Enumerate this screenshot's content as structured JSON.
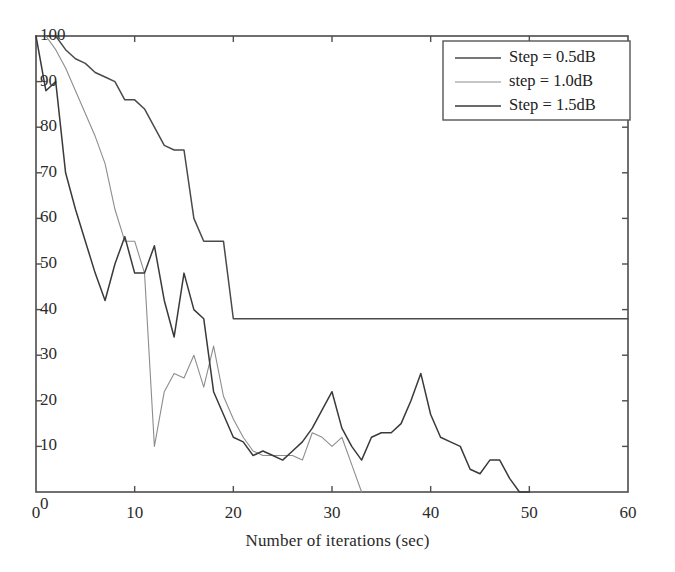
{
  "chart_data": {
    "type": "line",
    "title": "",
    "xlabel": "Number of iterations (sec)",
    "ylabel": "",
    "xlim": [
      0,
      60
    ],
    "ylim": [
      0,
      100
    ],
    "xticks": [
      0,
      10,
      20,
      30,
      40,
      50,
      60
    ],
    "yticks": [
      0,
      10,
      20,
      30,
      40,
      50,
      60,
      70,
      80,
      90,
      100
    ],
    "grid": false,
    "legend_position": "top-right",
    "series": [
      {
        "name": "Step = 0.5dB",
        "color": "#4a4a4a",
        "x": [
          0,
          1,
          2,
          3,
          4,
          5,
          6,
          7,
          8,
          9,
          10,
          11,
          12,
          13,
          14,
          15,
          16,
          17,
          18,
          19,
          20,
          25,
          30,
          35,
          40,
          45,
          50,
          55,
          60
        ],
        "y": [
          100,
          100,
          100,
          97,
          95,
          94,
          92,
          91,
          90,
          86,
          86,
          84,
          80,
          76,
          75,
          75,
          60,
          55,
          55,
          55,
          38,
          38,
          38,
          38,
          38,
          38,
          38,
          38,
          38
        ]
      },
      {
        "name": "step = 1.0dB",
        "color": "#8d8d8d",
        "x": [
          0,
          1,
          2,
          3,
          4,
          5,
          6,
          7,
          8,
          9,
          10,
          11,
          12,
          13,
          14,
          15,
          16,
          17,
          18,
          19,
          20,
          21,
          22,
          23,
          24,
          25,
          26,
          27,
          28,
          29,
          30,
          31,
          32,
          33
        ],
        "y": [
          100,
          100,
          97,
          93,
          88,
          83,
          78,
          72,
          62,
          55,
          55,
          48,
          10,
          22,
          26,
          25,
          30,
          23,
          32,
          21,
          16,
          12,
          9,
          8,
          8,
          8,
          8,
          7,
          13,
          12,
          10,
          12,
          6,
          0
        ]
      },
      {
        "name": "Step = 1.5dB",
        "color": "#3a3a3a",
        "x": [
          0,
          1,
          2,
          3,
          4,
          5,
          6,
          7,
          8,
          9,
          10,
          11,
          12,
          13,
          14,
          15,
          16,
          17,
          18,
          19,
          20,
          21,
          22,
          23,
          24,
          25,
          26,
          27,
          28,
          29,
          30,
          31,
          32,
          33,
          34,
          35,
          36,
          37,
          38,
          39,
          40,
          41,
          42,
          43,
          44,
          45,
          46,
          47,
          48,
          49,
          50
        ],
        "y": [
          100,
          88,
          90,
          70,
          62,
          55,
          48,
          42,
          50,
          56,
          48,
          48,
          54,
          42,
          34,
          48,
          40,
          38,
          22,
          17,
          12,
          11,
          8,
          9,
          8,
          7,
          9,
          11,
          14,
          18,
          22,
          14,
          10,
          7,
          12,
          13,
          13,
          15,
          20,
          26,
          17,
          12,
          11,
          10,
          5,
          4,
          7,
          7,
          3,
          0,
          0
        ]
      }
    ]
  },
  "legend": {
    "items": [
      {
        "label": "Step = 0.5dB"
      },
      {
        "label": "step = 1.0dB"
      },
      {
        "label": "Step = 1.5dB"
      }
    ]
  },
  "axes": {
    "x_tick_labels": [
      "0",
      "10",
      "20",
      "30",
      "40",
      "50",
      "60"
    ],
    "y_tick_labels": [
      "0",
      "10",
      "20",
      "30",
      "40",
      "50",
      "60",
      "70",
      "80",
      "90",
      "100"
    ],
    "x_axis_title": "Number of iterations (sec)",
    "y_origin_overlap_label": "0"
  }
}
